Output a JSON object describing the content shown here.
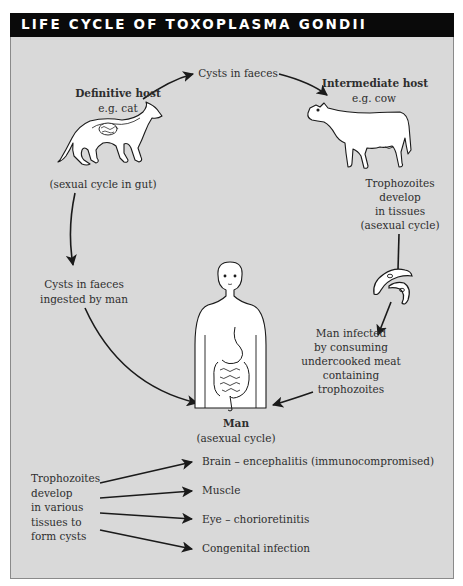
{
  "title": "LIFE CYCLE OF TOXOPLASMA GONDII",
  "colors": {
    "background": "#d9d9d9",
    "title_bar": "#0a0a0a",
    "title_text": "#ffffff",
    "text": "#2e2e2e",
    "arrow": "#1a1a1a",
    "illustration_fill": "#ffffff"
  },
  "nodes": {
    "definitive_host": {
      "title": "Definitive host",
      "example": "e.g. cat",
      "note": "(sexual cycle in gut)"
    },
    "cysts_in_faeces": {
      "label": "Cysts in faeces"
    },
    "intermediate_host": {
      "title": "Intermediate host",
      "example": "e.g. cow"
    },
    "trophozoites_develop": {
      "lines": [
        "Trophozoites",
        "develop",
        "in tissues",
        "(asexual cycle)"
      ]
    },
    "cysts_ingested": {
      "lines": [
        "Cysts in faeces",
        "ingested by man"
      ]
    },
    "man_infected": {
      "lines": [
        "Man infected",
        "by consuming",
        "undercooked meat",
        "containing",
        "trophozoites"
      ]
    },
    "man": {
      "title": "Man",
      "note": "(asexual cycle)"
    }
  },
  "illustrations": [
    "cat-with-gut",
    "cow",
    "trophozoites",
    "man-with-digestive-tract"
  ],
  "outcomes": {
    "source_lines": [
      "Trophozoites",
      "develop",
      "in various",
      "tissues to",
      "form cysts"
    ],
    "targets": [
      "Brain – encephalitis (immunocompromised)",
      "Muscle",
      "Eye – chorioretinitis",
      "Congenital infection"
    ]
  },
  "edges": [
    {
      "from": "Definitive host",
      "to": "Cysts in faeces"
    },
    {
      "from": "Cysts in faeces",
      "to": "Intermediate host"
    },
    {
      "from": "Intermediate host",
      "to": "Trophozoites develop in tissues"
    },
    {
      "from": "Trophozoites",
      "to": "Man infected by consuming undercooked meat"
    },
    {
      "from": "Man infected",
      "to": "Man"
    },
    {
      "from": "Definitive host",
      "to": "Cysts in faeces ingested by man"
    },
    {
      "from": "Cysts in faeces ingested by man",
      "to": "Man"
    },
    {
      "from": "Trophozoites develop in various tissues",
      "to": "Brain"
    },
    {
      "from": "Trophozoites develop in various tissues",
      "to": "Muscle"
    },
    {
      "from": "Trophozoites develop in various tissues",
      "to": "Eye"
    },
    {
      "from": "Trophozoites develop in various tissues",
      "to": "Congenital infection"
    }
  ]
}
